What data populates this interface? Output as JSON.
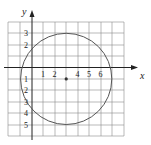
{
  "diagram": {
    "type": "coordinate-plane-circle",
    "axes": {
      "x_label": "x",
      "y_label": "y",
      "x_range": [
        -2,
        8
      ],
      "y_range": [
        -6,
        4
      ],
      "x_tick_labels": [
        "1",
        "2",
        "4",
        "5",
        "6"
      ],
      "y_tick_labels_positive": [
        "3",
        "2"
      ],
      "y_tick_labels_negative": [
        "1",
        "2",
        "3",
        "4",
        "5"
      ]
    },
    "circle": {
      "center": [
        3,
        -1
      ],
      "radius": 4,
      "color": "#555555"
    },
    "center_point": [
      3,
      -1
    ],
    "grid": true
  }
}
